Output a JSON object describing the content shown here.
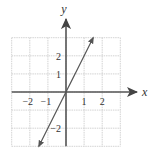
{
  "chart_data": {
    "type": "line",
    "title": "",
    "xlabel": "x",
    "ylabel": "y",
    "xlim": [
      -3,
      3
    ],
    "ylim": [
      -3,
      3
    ],
    "grid": true,
    "x_ticks": [
      {
        "value": -2,
        "label": "−2"
      },
      {
        "value": -1,
        "label": "−1"
      },
      {
        "value": 1,
        "label": "1"
      },
      {
        "value": 2,
        "label": "2"
      }
    ],
    "y_ticks": [
      {
        "value": 2,
        "label": "2"
      },
      {
        "value": 1,
        "label": "1"
      },
      {
        "value": -2,
        "label": "−2"
      }
    ],
    "series": [
      {
        "name": "y = 2x",
        "x": [
          -1.5,
          0,
          1.5
        ],
        "y": [
          -3,
          0,
          3
        ],
        "arrows_both_ends": true
      }
    ]
  },
  "colors": {
    "grid": "#c8c8c8",
    "axis": "#555555",
    "line": "#555555",
    "text": "#333333"
  }
}
